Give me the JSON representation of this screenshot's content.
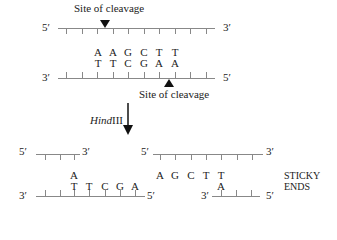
{
  "labels": {
    "site_top": "Site of cleavage",
    "site_bottom": "Site of cleavage",
    "enzyme": "HindIII",
    "enzyme_italic": "Hind",
    "enzyme_roman": "III",
    "sticky": "STICKY",
    "ends": "ENDS"
  },
  "ends": {
    "five": "5′",
    "three": "3′"
  },
  "top_dna": {
    "upper_strand": [
      "A",
      "A",
      "G",
      "C",
      "T",
      "T"
    ],
    "lower_strand": [
      "T",
      "T",
      "C",
      "G",
      "A",
      "A"
    ]
  },
  "left_fragment": {
    "overhang": "A",
    "lower_strand": [
      "T",
      "T",
      "C",
      "G",
      "A"
    ]
  },
  "right_fragment": {
    "upper_strand": [
      "A",
      "G",
      "C",
      "T",
      "T"
    ],
    "overhang": "A"
  },
  "colors": {
    "line": "#888888",
    "text": "#222222"
  }
}
